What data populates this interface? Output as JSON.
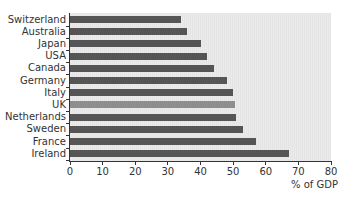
{
  "chart_data": {
    "type": "bar",
    "orientation": "horizontal",
    "title": "",
    "xlabel": "% of GDP",
    "ylabel": "",
    "xlim": [
      0,
      80
    ],
    "xticks": [
      0,
      10,
      20,
      30,
      40,
      50,
      60,
      70,
      80
    ],
    "grid": false,
    "legend": null,
    "categories": [
      "Switzerland",
      "Australia",
      "Japan",
      "USA",
      "Canada",
      "Germany",
      "Italy",
      "UK",
      "Netherlands",
      "Sweden",
      "France",
      "Ireland"
    ],
    "values": [
      34,
      36,
      40,
      42,
      44,
      48,
      50,
      50.5,
      51,
      53,
      57,
      67
    ],
    "highlighted": "UK",
    "colors": {
      "bar": "#555555",
      "highlight": "#8e8e8e",
      "plot_background": "#e8e8e8"
    }
  },
  "labels": {
    "categories": [
      "Switzerland",
      "Australia",
      "Japan",
      "USA",
      "Canada",
      "Germany",
      "Italy",
      "UK",
      "Netherlands",
      "Sweden",
      "France",
      "Ireland"
    ],
    "xticks": [
      "0",
      "10",
      "20",
      "30",
      "40",
      "50",
      "60",
      "70",
      "80"
    ],
    "axis_title": "% of GDP"
  }
}
